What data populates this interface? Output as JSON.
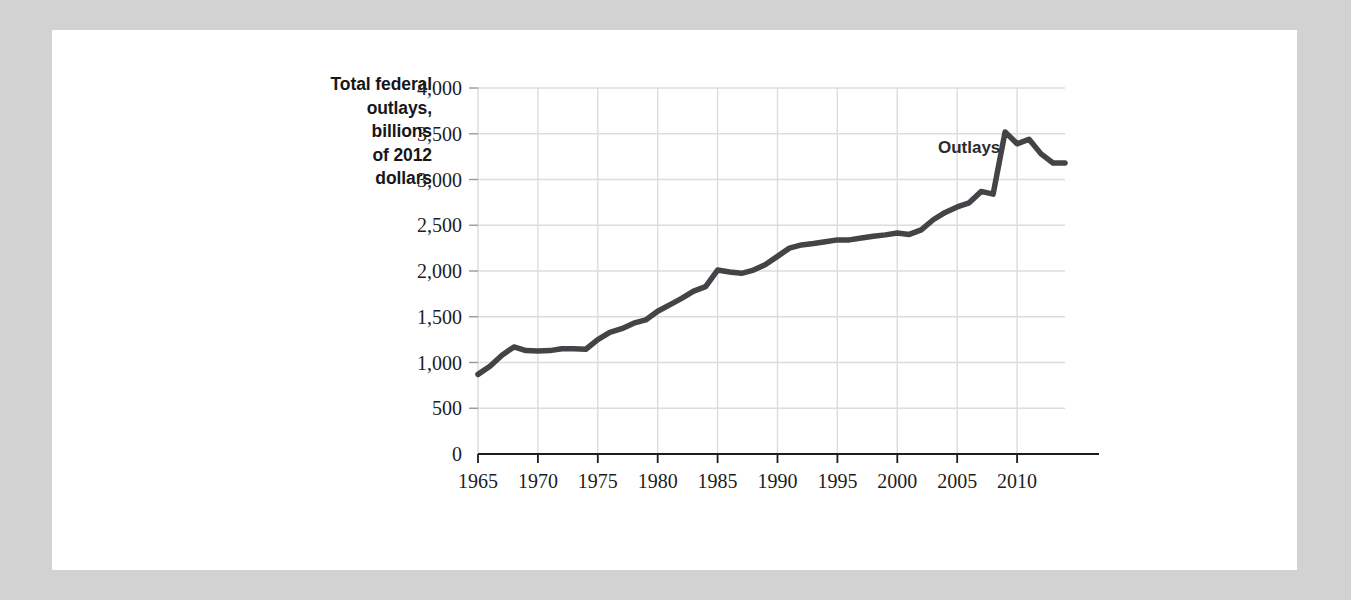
{
  "figure": {
    "background_color": "#d2d2d2",
    "card_color": "#ffffff",
    "axis_title_lines": [
      "Total federal",
      "outlays,",
      "billions",
      "of 2012",
      "dollars"
    ],
    "series_annotation": "Outlays"
  },
  "chart_data": {
    "type": "line",
    "title": "",
    "subtitle": "",
    "xlabel": "",
    "ylabel": "Total federal outlays, billions of 2012 dollars",
    "xlim": [
      1965,
      2014
    ],
    "ylim": [
      0,
      4000
    ],
    "grid": true,
    "legend_position": "inline-annotation",
    "annotations": [
      {
        "text": "Outlays",
        "x": 2006,
        "y": 3290
      }
    ],
    "x_tick_labels": [
      "1965",
      "1970",
      "1975",
      "1980",
      "1985",
      "1990",
      "1995",
      "2000",
      "2005",
      "2010"
    ],
    "x_ticks": [
      1965,
      1970,
      1975,
      1980,
      1985,
      1990,
      1995,
      2000,
      2005,
      2010
    ],
    "y_tick_labels": [
      "0",
      "500",
      "1,000",
      "1,500",
      "2,000",
      "2,500",
      "3,000",
      "3,500",
      "4,000"
    ],
    "y_ticks": [
      0,
      500,
      1000,
      1500,
      2000,
      2500,
      3000,
      3500,
      4000
    ],
    "line_color": "#444448",
    "grid_color": "#dcdcdc",
    "axis_color": "#1d1d1f",
    "series": [
      {
        "name": "Outlays",
        "x": [
          1965,
          1966,
          1967,
          1968,
          1969,
          1970,
          1971,
          1972,
          1973,
          1974,
          1975,
          1976,
          1977,
          1978,
          1979,
          1980,
          1981,
          1982,
          1983,
          1984,
          1985,
          1986,
          1987,
          1988,
          1989,
          1990,
          1991,
          1992,
          1993,
          1994,
          1995,
          1996,
          1997,
          1998,
          1999,
          2000,
          2001,
          2002,
          2003,
          2004,
          2005,
          2006,
          2007,
          2008,
          2009,
          2010,
          2011,
          2012,
          2013,
          2014
        ],
        "values": [
          870,
          960,
          1080,
          1170,
          1130,
          1125,
          1130,
          1150,
          1150,
          1145,
          1250,
          1330,
          1370,
          1430,
          1465,
          1560,
          1630,
          1700,
          1780,
          1830,
          2010,
          1990,
          1975,
          2010,
          2070,
          2160,
          2250,
          2285,
          2300,
          2320,
          2340,
          2340,
          2360,
          2380,
          2395,
          2415,
          2400,
          2450,
          2560,
          2640,
          2700,
          2745,
          2870,
          2840,
          3520,
          3390,
          3440,
          3280,
          3180,
          3180
        ]
      }
    ]
  }
}
